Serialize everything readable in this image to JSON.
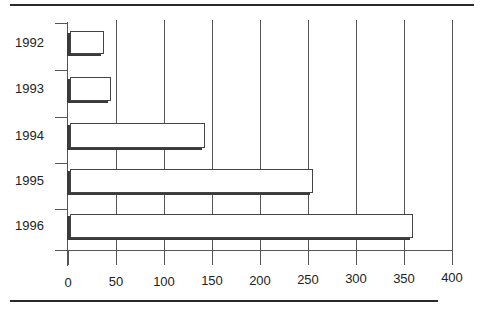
{
  "chart_data": {
    "type": "bar",
    "orientation": "horizontal",
    "title": "",
    "xlabel": "",
    "ylabel": "",
    "categories": [
      "1992",
      "1993",
      "1994",
      "1995",
      "1996"
    ],
    "values": [
      37,
      45,
      143,
      255,
      359
    ],
    "xlim": [
      0,
      400
    ],
    "x_ticks": [
      "0",
      "50",
      "100",
      "150",
      "200",
      "250",
      "300",
      "350",
      "400"
    ],
    "grid": "vertical",
    "legend": "none",
    "style": "3d-shadow bars, white fill, dark outline"
  }
}
